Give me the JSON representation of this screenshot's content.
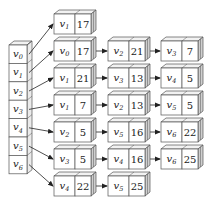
{
  "diagram": {
    "colors": {
      "front": "#ffffff",
      "top": "#f2f2f2",
      "side": "#cfcfcf",
      "stroke": "#555555",
      "arrow": "#222222"
    },
    "head_array": {
      "label": "vertex array",
      "vertices": [
        "v0",
        "v1",
        "v2",
        "v3",
        "v4",
        "v5",
        "v6"
      ]
    },
    "lists": [
      {
        "vertex": "v0",
        "nodes": [
          {
            "v": "v1",
            "w": "17"
          }
        ]
      },
      {
        "vertex": "v1",
        "nodes": [
          {
            "v": "v0",
            "w": "17"
          },
          {
            "v": "v2",
            "w": "21"
          },
          {
            "v": "v3",
            "w": "7"
          }
        ]
      },
      {
        "vertex": "v2",
        "nodes": [
          {
            "v": "v1",
            "w": "21"
          },
          {
            "v": "v3",
            "w": "13"
          },
          {
            "v": "v4",
            "w": "5"
          }
        ]
      },
      {
        "vertex": "v3",
        "nodes": [
          {
            "v": "v1",
            "w": "7"
          },
          {
            "v": "v2",
            "w": "13"
          },
          {
            "v": "v5",
            "w": "5"
          }
        ]
      },
      {
        "vertex": "v4",
        "nodes": [
          {
            "v": "v2",
            "w": "5"
          },
          {
            "v": "v5",
            "w": "16"
          },
          {
            "v": "v6",
            "w": "22"
          }
        ]
      },
      {
        "vertex": "v5",
        "nodes": [
          {
            "v": "v3",
            "w": "5"
          },
          {
            "v": "v4",
            "w": "16"
          },
          {
            "v": "v6",
            "w": "25"
          }
        ]
      },
      {
        "vertex": "v6",
        "nodes": [
          {
            "v": "v4",
            "w": "22"
          },
          {
            "v": "v5",
            "w": "25"
          }
        ]
      }
    ]
  }
}
